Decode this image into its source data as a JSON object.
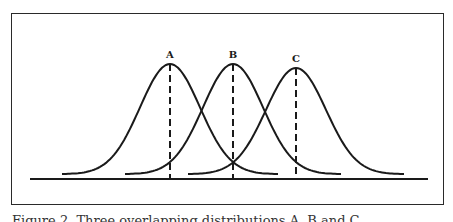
{
  "figure": {
    "caption": "Figure 2. Three overlapping distributions A, B and C",
    "curves": [
      {
        "label": "A",
        "mean": 0.0
      },
      {
        "label": "B",
        "mean": 1.0
      },
      {
        "label": "C",
        "mean": 2.0
      }
    ],
    "stroke_color": "#1a1a1a"
  }
}
